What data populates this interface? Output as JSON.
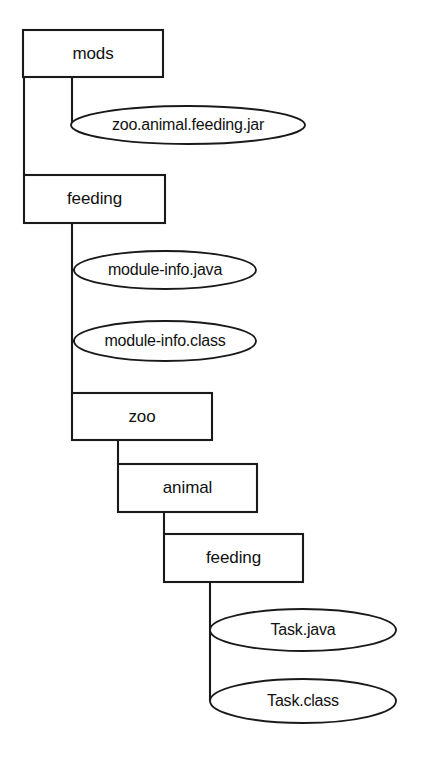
{
  "diagram": {
    "type": "directory-tree",
    "title": "",
    "background_color": "#ffffff",
    "line_color": "#1a1a1a",
    "text_color": "#111111",
    "folders": [
      {
        "id": "mods",
        "label": "mods",
        "level": 0,
        "shape": "rectangle",
        "x": 23,
        "y": 30,
        "w": 140,
        "h": 47
      },
      {
        "id": "feeding-top",
        "label": "feeding",
        "level": 1,
        "shape": "rectangle",
        "x": 24,
        "y": 175,
        "w": 141,
        "h": 48
      },
      {
        "id": "zoo",
        "label": "zoo",
        "level": 2,
        "shape": "rectangle",
        "x": 72,
        "y": 393,
        "w": 140,
        "h": 47
      },
      {
        "id": "animal",
        "label": "animal",
        "level": 3,
        "shape": "rectangle",
        "x": 118,
        "y": 464,
        "w": 139,
        "h": 48
      },
      {
        "id": "feeding-bottom",
        "label": "feeding",
        "level": 4,
        "shape": "rectangle",
        "x": 164,
        "y": 534,
        "w": 139,
        "h": 48
      }
    ],
    "files": [
      {
        "id": "zoo-animal-feeding-jar",
        "label": "zoo.animal.feeding.jar",
        "parent": "mods",
        "shape": "ellipse",
        "cx": 188,
        "cy": 125,
        "rx": 117,
        "ry": 19
      },
      {
        "id": "module-info-java",
        "label": "module-info.java",
        "parent": "feeding-top",
        "shape": "ellipse",
        "cx": 165,
        "cy": 270,
        "rx": 91,
        "ry": 19
      },
      {
        "id": "module-info-class",
        "label": "module-info.class",
        "parent": "feeding-top",
        "shape": "ellipse",
        "cx": 165,
        "cy": 341,
        "rx": 91,
        "ry": 20
      },
      {
        "id": "task-java",
        "label": "Task.java",
        "parent": "feeding-bottom",
        "shape": "ellipse",
        "cx": 303,
        "cy": 630,
        "rx": 93,
        "ry": 21
      },
      {
        "id": "task-class",
        "label": "Task.class",
        "parent": "feeding-bottom",
        "shape": "ellipse",
        "cx": 303,
        "cy": 701,
        "rx": 93,
        "ry": 22
      }
    ],
    "connectors": [
      {
        "id": "mods-to-jar",
        "path": "M 72 77 L 72 125"
      },
      {
        "id": "mods-to-feeding",
        "path": "M 24 77 L 24 175"
      },
      {
        "id": "feeding-to-children",
        "path": "M 72 223 L 72 393"
      },
      {
        "id": "feeding-to-module-java",
        "path": "M 72 270 L 74 270"
      },
      {
        "id": "feeding-to-module-class",
        "path": "M 72 341 L 74 341"
      },
      {
        "id": "zoo-to-animal",
        "path": "M 118 440 L 118 464"
      },
      {
        "id": "animal-to-feeding",
        "path": "M 164 512 L 164 534"
      },
      {
        "id": "feeding-to-tasks",
        "path": "M 210 582 L 210 701"
      }
    ]
  }
}
